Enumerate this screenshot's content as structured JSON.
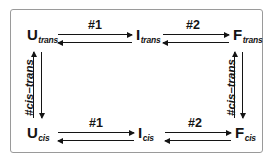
{
  "figure": {
    "border_color": "#9a9a9a",
    "ink_color": "#141414",
    "background": "#ffffff"
  },
  "states": {
    "u_trans": {
      "symbol": "U",
      "subscript": "trans"
    },
    "i_trans": {
      "symbol": "I",
      "subscript": "trans"
    },
    "f_trans": {
      "symbol": "F",
      "subscript": "trans"
    },
    "u_cis": {
      "symbol": "U",
      "subscript": "cis"
    },
    "i_cis": {
      "symbol": "I",
      "subscript": "cis"
    },
    "f_cis": {
      "symbol": "F",
      "subscript": "cis"
    }
  },
  "edge_labels": {
    "top_step1": "#1",
    "top_step2": "#2",
    "bottom_step1": "#1",
    "bottom_step2": "#2",
    "left_vertical": "#cis–trans",
    "right_vertical": "#cis–trans"
  },
  "chart_data": {
    "type": "diagram",
    "nodes": [
      {
        "id": "U_trans",
        "label": "U",
        "sub": "trans",
        "row": "trans",
        "col": 0
      },
      {
        "id": "I_trans",
        "label": "I",
        "sub": "trans",
        "row": "trans",
        "col": 1
      },
      {
        "id": "F_trans",
        "label": "F",
        "sub": "trans",
        "row": "trans",
        "col": 2
      },
      {
        "id": "U_cis",
        "label": "U",
        "sub": "cis",
        "row": "cis",
        "col": 0
      },
      {
        "id": "I_cis",
        "label": "I",
        "sub": "cis",
        "row": "cis",
        "col": 1
      },
      {
        "id": "F_cis",
        "label": "F",
        "sub": "cis",
        "row": "cis",
        "col": 2
      }
    ],
    "edges": [
      {
        "from": "U_trans",
        "to": "I_trans",
        "label": "#1",
        "direction": "bidirectional",
        "orientation": "horizontal"
      },
      {
        "from": "I_trans",
        "to": "F_trans",
        "label": "#2",
        "direction": "bidirectional",
        "orientation": "horizontal"
      },
      {
        "from": "U_cis",
        "to": "I_cis",
        "label": "#1",
        "direction": "bidirectional",
        "orientation": "horizontal"
      },
      {
        "from": "I_cis",
        "to": "F_cis",
        "label": "#2",
        "direction": "bidirectional",
        "orientation": "horizontal"
      },
      {
        "from": "U_cis",
        "to": "U_trans",
        "label": "#cis–trans",
        "direction": "bidirectional",
        "orientation": "vertical"
      },
      {
        "from": "F_cis",
        "to": "F_trans",
        "label": "#cis–trans",
        "direction": "bidirectional",
        "orientation": "vertical"
      }
    ]
  }
}
